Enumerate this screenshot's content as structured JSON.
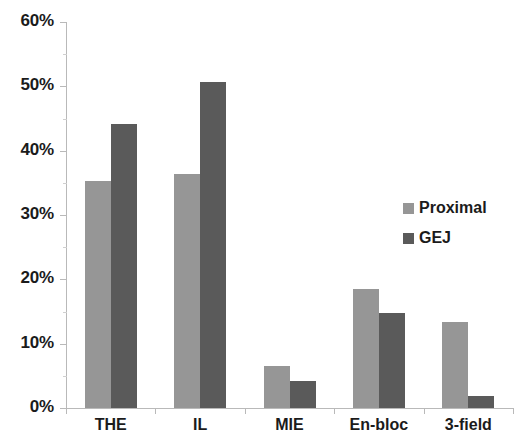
{
  "chart_data": {
    "type": "bar",
    "title": "",
    "subtitle": "",
    "xlabel": "",
    "ylabel": "",
    "categories": [
      "THE",
      "IL",
      "MIE",
      "En-bloc",
      "3-field"
    ],
    "series": [
      {
        "name": "Proximal",
        "color": "#969696",
        "values": [
          35.3,
          36.4,
          6.5,
          18.5,
          13.4
        ]
      },
      {
        "name": "GEJ",
        "color": "#5a5a5a",
        "values": [
          44.2,
          50.7,
          4.2,
          14.7,
          1.8
        ]
      }
    ],
    "ylim": [
      0,
      60
    ],
    "y_ticks": [
      0,
      10,
      20,
      30,
      40,
      50,
      60
    ],
    "y_tick_labels": [
      "0%",
      "10%",
      "20%",
      "30%",
      "40%",
      "50%",
      "60%"
    ],
    "grid": false,
    "legend_position": "right",
    "value_format": "percent"
  },
  "axis": {
    "y_labels": [
      "60%",
      "50%",
      "40%",
      "30%",
      "20%",
      "10%",
      "0%"
    ],
    "x_labels": [
      "THE",
      "IL",
      "MIE",
      "En-bloc",
      "3-field"
    ]
  },
  "legend": {
    "items": [
      {
        "label": "Proximal",
        "color": "#969696"
      },
      {
        "label": "GEJ",
        "color": "#5a5a5a"
      }
    ]
  },
  "colors": {
    "proximal": "#969696",
    "gej": "#5a5a5a",
    "axis": "#b9b9b9",
    "text": "#1b1b1b",
    "background": "#ffffff"
  }
}
